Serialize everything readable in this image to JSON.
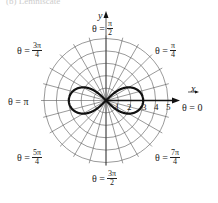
{
  "header": {
    "cutoff_text": "(b) Lemniscate"
  },
  "axes": {
    "x_label": "x",
    "y_label": "y"
  },
  "grid": {
    "rings": 5,
    "ring_spacing_px": 12.4,
    "spoke_step_deg": 15,
    "center": [
      106,
      100.5
    ]
  },
  "ticks": [
    "1",
    "2",
    "3",
    "4",
    "5"
  ],
  "angle_labels": {
    "zero": {
      "lhs": "θ = 0"
    },
    "pi": {
      "lhs": "θ = π"
    },
    "pi_over_2": {
      "lhs": "θ =",
      "num": "π",
      "den": "2"
    },
    "pi_over_4": {
      "lhs": "θ =",
      "num": "π",
      "den": "4"
    },
    "three_pi_over_4": {
      "lhs": "θ =",
      "num": "3π",
      "den": "4"
    },
    "five_pi_over_4": {
      "lhs": "θ =",
      "num": "5π",
      "den": "4"
    },
    "three_pi_over_2": {
      "lhs": "θ =",
      "num": "3π",
      "den": "2"
    },
    "seven_pi_over_4": {
      "lhs": "θ =",
      "num": "7π",
      "den": "4"
    }
  },
  "curve": {
    "equation": "r^2 = 9cos(2θ)",
    "max_r": 3,
    "color": "#111111"
  }
}
